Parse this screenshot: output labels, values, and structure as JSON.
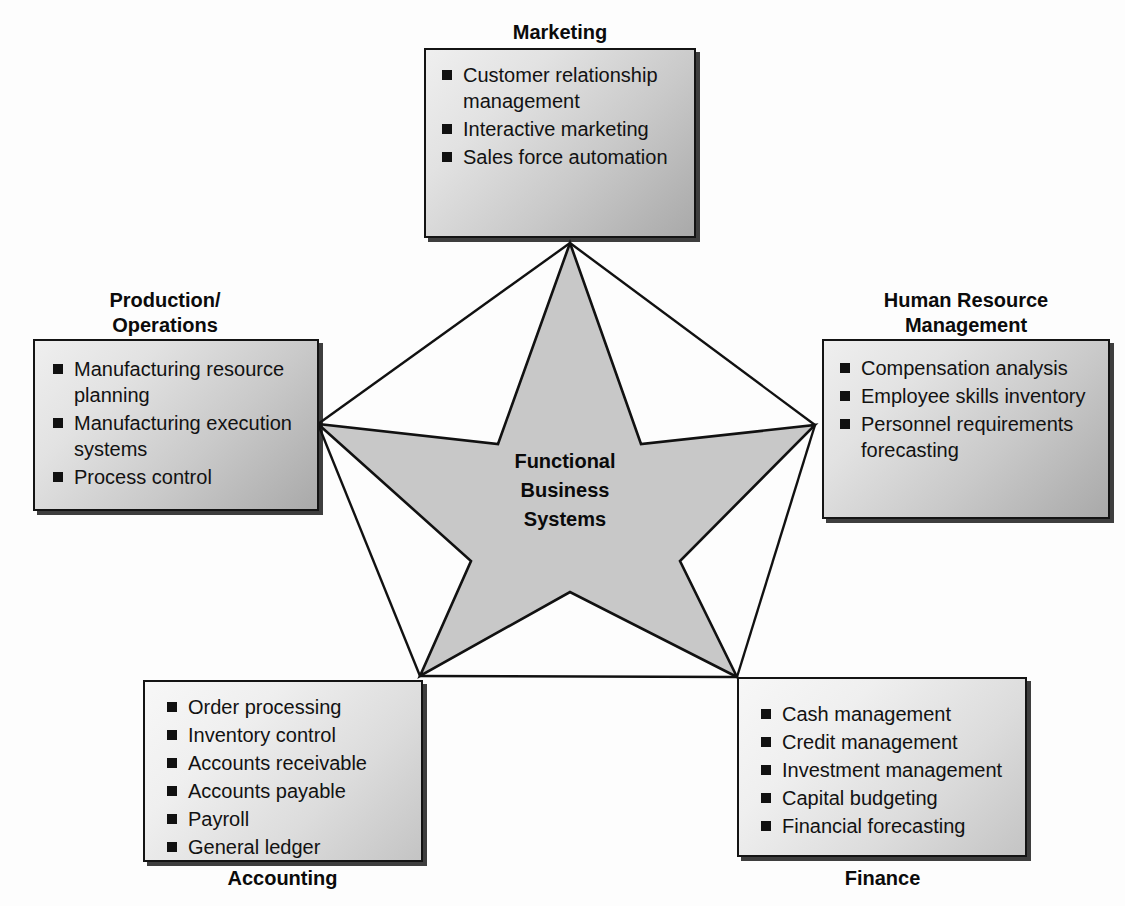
{
  "diagram": {
    "center": {
      "label_lines": [
        "Functional",
        "Business",
        "Systems"
      ],
      "shape": "five-pointed-star",
      "fill_color": "#c8c8c8",
      "stroke_color": "#111111"
    },
    "nodes": [
      {
        "id": "marketing",
        "caption": "Marketing",
        "caption_position": "above",
        "items": [
          "Customer relationship management",
          "Interactive marketing",
          "Sales force automation"
        ]
      },
      {
        "id": "production",
        "caption": "Production/\nOperations",
        "caption_position": "above",
        "items": [
          "Manufacturing resource planning",
          "Manufacturing execution systems",
          "Process control"
        ]
      },
      {
        "id": "human-resource-management",
        "caption": "Human Resource\nManagement",
        "caption_position": "above",
        "items": [
          "Compensation analysis",
          "Employee skills inventory",
          "Personnel requirements forecasting"
        ]
      },
      {
        "id": "accounting",
        "caption": "Accounting",
        "caption_position": "below",
        "items": [
          "Order processing",
          "Inventory control",
          "Accounts receivable",
          "Accounts payable",
          "Payroll",
          "General ledger"
        ]
      },
      {
        "id": "finance",
        "caption": "Finance",
        "caption_position": "below",
        "items": [
          "Cash management",
          "Credit management",
          "Investment management",
          "Capital budgeting",
          "Financial forecasting"
        ]
      }
    ],
    "icons": {
      "bullet": "black-square-bullet",
      "connector": "arrow-connector"
    },
    "colors": {
      "panel_border": "#141414",
      "panel_fill_light": "#efefef",
      "panel_fill_dark": "#a9a9a9",
      "star_fill": "#c8c8c8",
      "line": "#111111",
      "text": "#0b0b0b",
      "background": "#fdfdfd"
    }
  }
}
